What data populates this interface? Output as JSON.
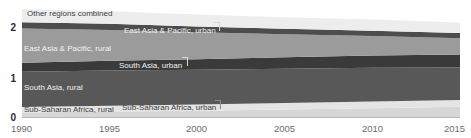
{
  "chart_data": {
    "type": "area",
    "title": "",
    "xlabel": "",
    "ylabel": "",
    "stacked": true,
    "grid": false,
    "legend_position": "inline-labels",
    "xlim": [
      1990,
      2015
    ],
    "ylim": [
      0,
      2.35
    ],
    "x_ticks": [
      "1990",
      "1995",
      "2000",
      "2005",
      "2010",
      "2015"
    ],
    "x_tick_values": [
      1990,
      1995,
      2000,
      2005,
      2010,
      2015
    ],
    "y_ticks": [
      "0",
      "1",
      "2"
    ],
    "y_tick_values": [
      0,
      1,
      2
    ],
    "x": [
      1990,
      1995,
      2000,
      2005,
      2010,
      2015
    ],
    "series": [
      {
        "name": "Sub-Saharan Africa, urban",
        "color": "#d7d7d7",
        "values": [
          0.09,
          0.11,
          0.13,
          0.155,
          0.18,
          0.21
        ]
      },
      {
        "name": "Sub-Saharan Africa, rural",
        "color": "#e4e4e4",
        "values": [
          0.115,
          0.12,
          0.125,
          0.13,
          0.135,
          0.135
        ]
      },
      {
        "name": "South Asia, rural",
        "color": "#585858",
        "values": [
          0.72,
          0.72,
          0.71,
          0.7,
          0.69,
          0.665
        ]
      },
      {
        "name": "South Asia, urban",
        "color": "#3a3a3a",
        "values": [
          0.185,
          0.2,
          0.215,
          0.235,
          0.25,
          0.265
        ]
      },
      {
        "name": "East Asia & Pacific, rural",
        "color": "#9b9b9b",
        "values": [
          0.7,
          0.63,
          0.55,
          0.47,
          0.4,
          0.335
        ]
      },
      {
        "name": "East Asia & Pacific, urban",
        "color": "#4d4d4d",
        "values": [
          0.125,
          0.125,
          0.12,
          0.115,
          0.11,
          0.105
        ]
      },
      {
        "name": "Other regions combined",
        "color": "#ededed",
        "values": [
          0.27,
          0.255,
          0.245,
          0.235,
          0.225,
          0.215
        ]
      }
    ],
    "inline_labels": [
      {
        "text": "Other regions combined",
        "series": "Other regions combined",
        "style": "dark",
        "leader": false
      },
      {
        "text": "East Asia & Pacific, urban",
        "series": "East Asia & Pacific, urban",
        "style": "light",
        "leader": true
      },
      {
        "text": "East Asia & Pacific, rural",
        "series": "East Asia & Pacific, rural",
        "style": "light",
        "leader": false
      },
      {
        "text": "South Asia, urban",
        "series": "South Asia, urban",
        "style": "light",
        "leader": true
      },
      {
        "text": "South Asia, rural",
        "series": "South Asia, rural",
        "style": "light",
        "leader": false
      },
      {
        "text": "Sub-Saharan Africa, rural",
        "series": "Sub-Saharan Africa, rural",
        "style": "dark",
        "leader": false
      },
      {
        "text": "Sub-Saharan Africa, urban",
        "series": "Sub-Saharan Africa, urban",
        "style": "dark",
        "leader": true
      }
    ],
    "axis_color": "#b9b9b9",
    "tick_label_color": "#6d6d6d",
    "y_label_color": "#2b2b2b",
    "background": "#ffffff"
  }
}
